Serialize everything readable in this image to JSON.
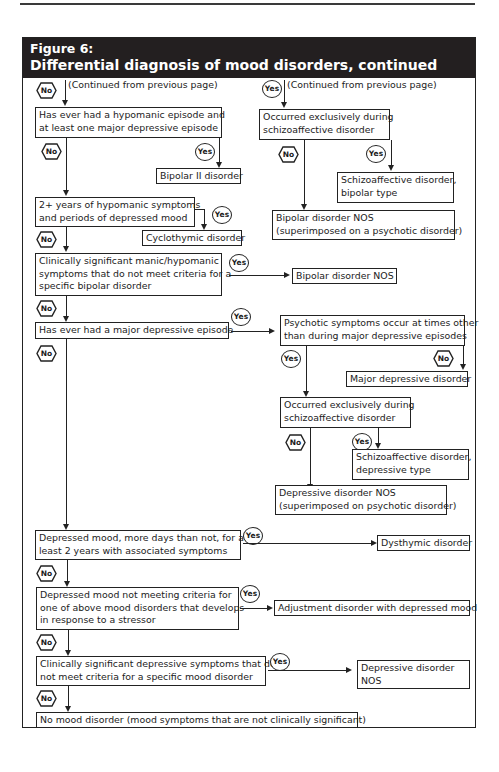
{
  "figure": {
    "label": "Figure 6:",
    "title": "Differential diagnosis of mood disorders, continued"
  },
  "badges": {
    "yes": "Yes",
    "no": "No"
  },
  "left_branch": {
    "continued_note": "(Continued from previous page)",
    "q1": {
      "line1": "Has ever had a hypomanic episode and",
      "line2": "at least one major depressive episode"
    },
    "r1": "Bipolar II disorder",
    "q2": {
      "line1": "2+ years of hypomanic symptoms",
      "line2": "and periods of depressed mood"
    },
    "r2": "Cyclothymic disorder",
    "q3": {
      "line1": "Clinically significant manic/hypomanic",
      "line2": "symptoms that do not meet criteria for a",
      "line3": "specific bipolar disorder"
    },
    "r3": "Bipolar disorder NOS",
    "q4": "Has ever had a major depressive episode",
    "q5": {
      "line1": "Depressed mood, more days than not, for at",
      "line2": "least 2 years with associated symptoms"
    },
    "r5": "Dysthymic disorder",
    "q6": {
      "line1": "Depressed mood not meeting criteria for",
      "line2": "one of above mood disorders that develops",
      "line3": "in response to a stressor"
    },
    "r6": "Adjustment disorder with depressed mood",
    "q7": {
      "line1": "Clinically significant depressive symptoms that do",
      "line2": "not meet criteria for a specific mood disorder"
    },
    "r7": {
      "line1": "Depressive disorder",
      "line2": "NOS"
    },
    "r_final": "No mood disorder (mood symptoms that are not clinically significant)"
  },
  "right_branch": {
    "continued_note": "(Continued from previous page)",
    "q1": {
      "line1": "Occurred exclusively during",
      "line2": "schizoaffective disorder"
    },
    "r1_yes": {
      "line1": "Schizoaffective disorder,",
      "line2": "bipolar type"
    },
    "r1_no": {
      "line1": "Bipolar disorder NOS",
      "line2": "(superimposed on a psychotic disorder)"
    }
  },
  "mdd_branch": {
    "q1": {
      "line1": "Psychotic symptoms occur at times other",
      "line2": "than during major depressive episodes"
    },
    "r1_no": "Major depressive disorder",
    "q2": {
      "line1": "Occurred exclusively during",
      "line2": "schizoaffective disorder"
    },
    "r2_yes": {
      "line1": "Schizoaffective disorder,",
      "line2": "depressive type"
    },
    "r2_no": {
      "line1": "Depressive disorder NOS",
      "line2": "(superimposed on psychotic disorder)"
    }
  }
}
